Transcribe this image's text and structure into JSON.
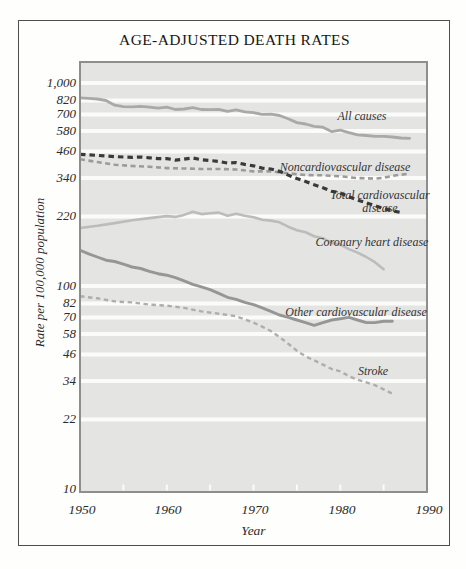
{
  "figure_type": "scanned statistical line chart",
  "colors": {
    "page_bg": "#fefefd",
    "frame_border": "#4e4e4e",
    "plot_bg": "#e4e4e3",
    "gridline": "#fbfbf9",
    "plot_border": "#8e8e8e",
    "tick_text": "#2a2a2a",
    "label_text": "#333333",
    "title_text": "#161616"
  },
  "chart_data": {
    "type": "line",
    "title": "AGE-ADJUSTED DEATH RATES",
    "xlabel": "Year",
    "ylabel": "Rate per 100,000 population",
    "grid": "horizontal white gridlines at every labeled y tick, gray plot background",
    "legend_position": "inline labels beside each line",
    "x_axis": {
      "min": 1950,
      "max": 1990,
      "tick_labels": [
        "1950",
        "1960",
        "1970",
        "1980",
        "1990"
      ],
      "tick_values": [
        1950,
        1960,
        1970,
        1980,
        1990
      ],
      "minor_ticks": [
        1955,
        1960,
        1965,
        1970,
        1975,
        1980,
        1985
      ]
    },
    "y_axis": {
      "scale": "log",
      "min": 10,
      "max": 1100,
      "tick_labels": [
        "1,000",
        "820",
        "700",
        "580",
        "460",
        "340",
        "220",
        "100",
        "82",
        "70",
        "58",
        "46",
        "34",
        "22",
        "10"
      ],
      "tick_values": [
        1000,
        820,
        700,
        580,
        460,
        340,
        220,
        100,
        82,
        70,
        58,
        46,
        34,
        22,
        10
      ]
    },
    "series": [
      {
        "id": "all_causes",
        "label": "All causes",
        "line_style": "solid",
        "color": "#a9a9a9",
        "points": [
          [
            1950,
            845
          ],
          [
            1951,
            840
          ],
          [
            1952,
            834
          ],
          [
            1953,
            820
          ],
          [
            1954,
            777
          ],
          [
            1955,
            765
          ],
          [
            1956,
            763
          ],
          [
            1957,
            768
          ],
          [
            1958,
            760
          ],
          [
            1959,
            751
          ],
          [
            1960,
            761
          ],
          [
            1961,
            740
          ],
          [
            1962,
            745
          ],
          [
            1963,
            756
          ],
          [
            1964,
            740
          ],
          [
            1965,
            739
          ],
          [
            1966,
            742
          ],
          [
            1967,
            725
          ],
          [
            1968,
            738
          ],
          [
            1969,
            721
          ],
          [
            1970,
            714
          ],
          [
            1971,
            700
          ],
          [
            1972,
            702
          ],
          [
            1973,
            692
          ],
          [
            1974,
            666
          ],
          [
            1975,
            638
          ],
          [
            1976,
            628
          ],
          [
            1977,
            612
          ],
          [
            1978,
            606
          ],
          [
            1979,
            577
          ],
          [
            1980,
            586
          ],
          [
            1981,
            569
          ],
          [
            1982,
            555
          ],
          [
            1983,
            551
          ],
          [
            1984,
            546
          ],
          [
            1985,
            546
          ],
          [
            1986,
            542
          ],
          [
            1987,
            536
          ],
          [
            1988,
            534
          ]
        ]
      },
      {
        "id": "noncardiovascular",
        "label": "Noncardiovascular disease",
        "line_style": "dashed",
        "color": "#9b9b9b",
        "points": [
          [
            1950,
            421
          ],
          [
            1952,
            408
          ],
          [
            1954,
            396
          ],
          [
            1956,
            390
          ],
          [
            1958,
            387
          ],
          [
            1960,
            381
          ],
          [
            1962,
            379
          ],
          [
            1964,
            377
          ],
          [
            1966,
            377
          ],
          [
            1968,
            375
          ],
          [
            1970,
            367
          ],
          [
            1972,
            367
          ],
          [
            1974,
            359
          ],
          [
            1976,
            352
          ],
          [
            1978,
            351
          ],
          [
            1980,
            347
          ],
          [
            1982,
            340
          ],
          [
            1984,
            338
          ],
          [
            1985,
            341
          ],
          [
            1986,
            349
          ],
          [
            1988,
            358
          ]
        ]
      },
      {
        "id": "total_cardiovascular",
        "label": "Total cardiovascular disease",
        "label_lines": [
          "Total cardiovascular",
          "disease"
        ],
        "line_style": "dashed",
        "color": "#3a3a3a",
        "points": [
          [
            1950,
            445
          ],
          [
            1952,
            440
          ],
          [
            1954,
            434
          ],
          [
            1956,
            430
          ],
          [
            1957,
            432
          ],
          [
            1958,
            428
          ],
          [
            1959,
            424
          ],
          [
            1960,
            424
          ],
          [
            1961,
            417
          ],
          [
            1962,
            422
          ],
          [
            1963,
            427
          ],
          [
            1964,
            419
          ],
          [
            1965,
            415
          ],
          [
            1966,
            411
          ],
          [
            1967,
            403
          ],
          [
            1968,
            406
          ],
          [
            1969,
            397
          ],
          [
            1970,
            391
          ],
          [
            1971,
            381
          ],
          [
            1972,
            377
          ],
          [
            1973,
            367
          ],
          [
            1974,
            352
          ],
          [
            1975,
            338
          ],
          [
            1976,
            327
          ],
          [
            1977,
            315
          ],
          [
            1978,
            305
          ],
          [
            1979,
            293
          ],
          [
            1980,
            287
          ],
          [
            1981,
            275
          ],
          [
            1982,
            265
          ],
          [
            1983,
            257
          ],
          [
            1984,
            249
          ],
          [
            1985,
            241
          ],
          [
            1986,
            235
          ],
          [
            1987,
            230
          ]
        ]
      },
      {
        "id": "coronary_heart_disease",
        "label": "Coronary heart disease",
        "line_style": "solid",
        "color": "#bcbcbc",
        "points": [
          [
            1950,
            193
          ],
          [
            1952,
            198
          ],
          [
            1954,
            204
          ],
          [
            1956,
            211
          ],
          [
            1958,
            216
          ],
          [
            1960,
            221
          ],
          [
            1961,
            219
          ],
          [
            1962,
            224
          ],
          [
            1963,
            232
          ],
          [
            1964,
            226
          ],
          [
            1965,
            228
          ],
          [
            1966,
            230
          ],
          [
            1967,
            222
          ],
          [
            1968,
            227
          ],
          [
            1969,
            222
          ],
          [
            1970,
            218
          ],
          [
            1971,
            212
          ],
          [
            1972,
            210
          ],
          [
            1973,
            206
          ],
          [
            1974,
            196
          ],
          [
            1975,
            188
          ],
          [
            1976,
            184
          ],
          [
            1977,
            176
          ],
          [
            1978,
            172
          ],
          [
            1979,
            163
          ],
          [
            1980,
            160
          ],
          [
            1981,
            152
          ],
          [
            1982,
            146
          ],
          [
            1983,
            139
          ],
          [
            1984,
            131
          ],
          [
            1985,
            121
          ]
        ]
      },
      {
        "id": "other_cardiovascular",
        "label": "Other cardiovascular disease",
        "line_style": "solid",
        "color": "#969696",
        "points": [
          [
            1950,
            150
          ],
          [
            1951,
            144
          ],
          [
            1952,
            139
          ],
          [
            1953,
            134
          ],
          [
            1954,
            132
          ],
          [
            1955,
            128
          ],
          [
            1956,
            124
          ],
          [
            1957,
            122
          ],
          [
            1958,
            118
          ],
          [
            1959,
            115
          ],
          [
            1960,
            113
          ],
          [
            1961,
            110
          ],
          [
            1962,
            106
          ],
          [
            1963,
            102
          ],
          [
            1964,
            99
          ],
          [
            1965,
            96
          ],
          [
            1966,
            92
          ],
          [
            1967,
            88
          ],
          [
            1968,
            86
          ],
          [
            1969,
            83
          ],
          [
            1970,
            81
          ],
          [
            1971,
            78
          ],
          [
            1972,
            75
          ],
          [
            1973,
            72
          ],
          [
            1974,
            70
          ],
          [
            1975,
            68
          ],
          [
            1976,
            66
          ],
          [
            1977,
            64
          ],
          [
            1978,
            66
          ],
          [
            1979,
            68
          ],
          [
            1980,
            69
          ],
          [
            1981,
            70
          ],
          [
            1982,
            68
          ],
          [
            1983,
            66
          ],
          [
            1984,
            66
          ],
          [
            1985,
            67
          ],
          [
            1986,
            67
          ]
        ]
      },
      {
        "id": "stroke",
        "label": "Stroke",
        "line_style": "dashed",
        "color": "#aeaeae",
        "points": [
          [
            1950,
            89
          ],
          [
            1952,
            87
          ],
          [
            1954,
            84
          ],
          [
            1956,
            83
          ],
          [
            1958,
            81
          ],
          [
            1960,
            80
          ],
          [
            1962,
            78
          ],
          [
            1964,
            75
          ],
          [
            1966,
            73
          ],
          [
            1968,
            71
          ],
          [
            1970,
            66
          ],
          [
            1971,
            63
          ],
          [
            1972,
            60
          ],
          [
            1973,
            56
          ],
          [
            1974,
            52
          ],
          [
            1975,
            48
          ],
          [
            1976,
            45
          ],
          [
            1977,
            43
          ],
          [
            1978,
            41
          ],
          [
            1979,
            39
          ],
          [
            1980,
            38
          ],
          [
            1981,
            36
          ],
          [
            1982,
            34.5
          ],
          [
            1983,
            33.5
          ],
          [
            1984,
            32.5
          ],
          [
            1985,
            31
          ],
          [
            1986,
            29.5
          ]
        ]
      }
    ]
  }
}
